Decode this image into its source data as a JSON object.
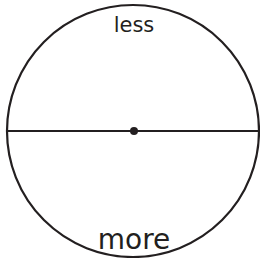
{
  "diagram": {
    "top_label": "less",
    "bottom_label": "more",
    "stroke_color": "#231f20",
    "background": "#ffffff",
    "shapes": {
      "circle": {
        "cx": 133,
        "cy": 131,
        "r": 126
      },
      "diameter": {
        "orientation": "horizontal",
        "y": 131
      },
      "center_point": {
        "cx": 134,
        "cy": 131
      }
    }
  }
}
